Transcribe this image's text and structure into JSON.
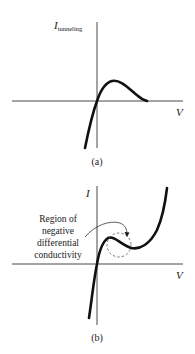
{
  "figure_a": {
    "y_axis_label_main": "I",
    "y_axis_label_sub": "tunneling",
    "x_axis_label": "V",
    "caption": "(a)"
  },
  "figure_b": {
    "y_axis_label": "I",
    "x_axis_label": "V",
    "annotation_lines": [
      "Region of",
      "negative",
      "differential",
      "conductivity"
    ],
    "caption": "(b)"
  },
  "colors": {
    "ink": "#1a1a1a",
    "background": "#ffffff"
  }
}
